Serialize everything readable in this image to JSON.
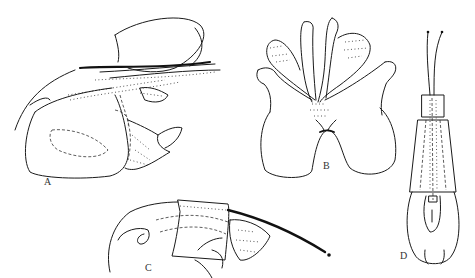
{
  "figure": {
    "panels": [
      {
        "id": "A",
        "label": "A",
        "description": "lateral view of genital segment"
      },
      {
        "id": "B",
        "label": "B",
        "description": "ventral view of plate with lobes"
      },
      {
        "id": "C",
        "label": "C",
        "description": "lateral view of appendage with long filament"
      },
      {
        "id": "D",
        "label": "D",
        "description": "elongate tube with two terminal filaments"
      }
    ],
    "colors": {
      "ink": "#1a1a1a",
      "background": "#ffffff"
    }
  }
}
